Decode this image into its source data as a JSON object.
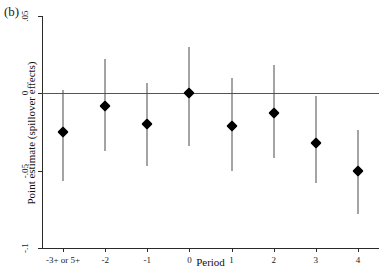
{
  "figure": {
    "panel_label": "(b)"
  },
  "chart_data": {
    "type": "scatter",
    "title": "",
    "xlabel": "Period",
    "ylabel": "Point estimate (spillover effects)",
    "categories": [
      "-3+ or 5+",
      "-2",
      "-1",
      "0",
      "1",
      "2",
      "3",
      "4"
    ],
    "values": [
      -0.025,
      -0.008,
      -0.02,
      0.0,
      -0.021,
      -0.013,
      -0.032,
      -0.05
    ],
    "ci_low": [
      -0.057,
      -0.037,
      -0.047,
      -0.034,
      -0.05,
      -0.042,
      -0.058,
      -0.078
    ],
    "ci_high": [
      0.002,
      0.022,
      0.007,
      0.03,
      0.01,
      0.018,
      -0.002,
      -0.024
    ],
    "yticks": [
      0.05,
      0,
      -0.05,
      -0.1
    ],
    "ytick_labels": [
      ".05",
      "0",
      "-.05",
      "-.1"
    ],
    "ylim": [
      -0.1,
      0.05
    ],
    "grid": false,
    "legend": null,
    "reference_line": 0,
    "series": [
      {
        "name": "Spillover point estimate",
        "marker": "filled-diamond",
        "error_bars": "vertical confidence interval",
        "values": [
          -0.025,
          -0.008,
          -0.02,
          0.0,
          -0.021,
          -0.013,
          -0.032,
          -0.05
        ]
      }
    ]
  },
  "colors": {
    "marker": "#000000",
    "ci_bar": "#4a4a4a",
    "axis": "#2a2a2a",
    "zero_line": "#555555",
    "background": "#ffffff"
  }
}
